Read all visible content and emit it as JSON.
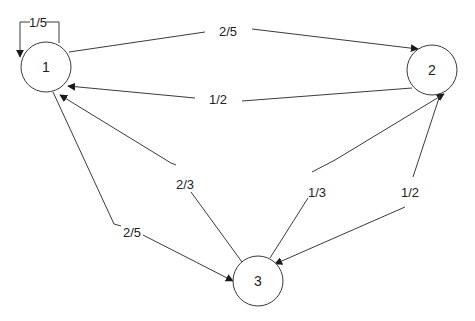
{
  "diagram": {
    "type": "markov-chain-state-transition",
    "nodes": [
      {
        "id": "1",
        "label": "1",
        "cx": 46,
        "cy": 67,
        "r": 25
      },
      {
        "id": "2",
        "label": "2",
        "cx": 432,
        "cy": 70,
        "r": 25
      },
      {
        "id": "3",
        "label": "3",
        "cx": 258,
        "cy": 281,
        "r": 25
      }
    ],
    "edges": [
      {
        "from": "1",
        "to": "1",
        "label": "1/5"
      },
      {
        "from": "1",
        "to": "2",
        "label": "2/5"
      },
      {
        "from": "2",
        "to": "1",
        "label": "1/2"
      },
      {
        "from": "3",
        "to": "1",
        "label": "2/3"
      },
      {
        "from": "1",
        "to": "3",
        "label": "2/5"
      },
      {
        "from": "3",
        "to": "2",
        "label": "1/3"
      },
      {
        "from": "2",
        "to": "3",
        "label": "1/2"
      }
    ],
    "colors": {
      "stroke": "#3a3a3a",
      "text": "#222222",
      "background": "#ffffff"
    }
  }
}
